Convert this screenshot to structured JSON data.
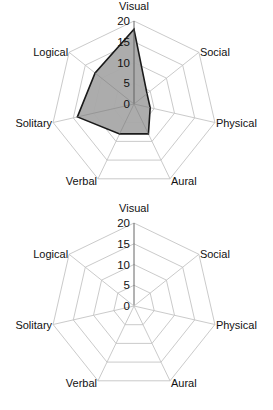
{
  "chart_data": [
    {
      "type": "radar",
      "title": "",
      "categories": [
        "Visual",
        "Social",
        "Physical",
        "Aural",
        "Verbal",
        "Solitary",
        "Logical"
      ],
      "series": [
        {
          "name": "Series 1",
          "values": [
            18,
            4,
            4,
            8,
            8,
            14,
            12
          ]
        }
      ],
      "radial_ticks": [
        "0",
        "5",
        "10",
        "15",
        "20"
      ],
      "rlim": [
        0,
        20
      ],
      "grid": true,
      "legend": "none",
      "colors": {
        "fill": "#a8a8a8",
        "outline": "#1a1a1a",
        "grid": "#c4c4c4"
      }
    },
    {
      "type": "radar",
      "title": "",
      "categories": [
        "Visual",
        "Social",
        "Physical",
        "Aural",
        "Verbal",
        "Solitary",
        "Logical"
      ],
      "series": [],
      "radial_ticks": [
        "0",
        "5",
        "10",
        "15",
        "20"
      ],
      "rlim": [
        0,
        20
      ],
      "grid": true,
      "legend": "none",
      "colors": {
        "grid": "#c4c4c4"
      }
    }
  ]
}
